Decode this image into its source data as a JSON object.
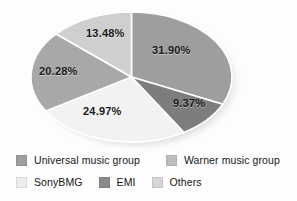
{
  "chart_data": {
    "type": "pie",
    "title": "",
    "subtitle": "",
    "xlabel": "",
    "ylabel": "",
    "grid": false,
    "legend_position": "bottom",
    "categories": [
      "Universal music group",
      "EMI",
      "SonyBMG",
      "Warner music group",
      "Others"
    ],
    "values": [
      31.9,
      9.37,
      24.97,
      20.28,
      13.48
    ],
    "value_labels": [
      "31.90%",
      "9.37%",
      "24.97%",
      "20.28%",
      "13.48%"
    ],
    "colors": [
      "#9e9e9e",
      "#7d7d7d",
      "#f2f2f2",
      "#a8a8a8",
      "#cfcfcf"
    ],
    "slices": [
      {
        "name": "Universal music group",
        "value": 31.9,
        "label": "31.90%",
        "color": "#9e9e9e",
        "start_angle": 0,
        "end_angle": 114.84
      },
      {
        "name": "EMI",
        "value": 9.37,
        "label": "9.37%",
        "color": "#7d7d7d",
        "start_angle": 114.84,
        "end_angle": 148.57
      },
      {
        "name": "SonyBMG",
        "value": 24.97,
        "label": "24.97%",
        "color": "#f2f2f2",
        "start_angle": 148.57,
        "end_angle": 238.46
      },
      {
        "name": "Warner music group",
        "value": 20.28,
        "label": "20.28%",
        "color": "#a8a8a8",
        "start_angle": 238.46,
        "end_angle": 311.47
      },
      {
        "name": "Others",
        "value": 13.48,
        "label": "13.48%",
        "color": "#cfcfcf",
        "start_angle": 311.47,
        "end_angle": 360
      }
    ]
  },
  "legend": {
    "row1": [
      {
        "label": "Universal music group",
        "color": "#9e9e9e"
      },
      {
        "label": "Warner music group",
        "color": "#bdbdbd"
      }
    ],
    "row2": [
      {
        "label": "SonyBMG",
        "color": "#ededed"
      },
      {
        "label": "EMI",
        "color": "#8a8a8a"
      },
      {
        "label": "Others",
        "color": "#d6d6d6"
      }
    ]
  }
}
